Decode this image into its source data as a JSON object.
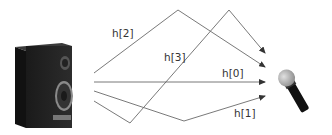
{
  "diagram": {
    "source": {
      "label": "loudspeaker",
      "icon": "speaker-icon"
    },
    "receiver": {
      "label": "microphone",
      "icon": "microphone-icon"
    },
    "paths": [
      {
        "id": "h0",
        "label": "h[0]"
      },
      {
        "id": "h1",
        "label": "h[1]"
      },
      {
        "id": "h2",
        "label": "h[2]"
      },
      {
        "id": "h3",
        "label": "h[3]"
      }
    ],
    "line_color": "#666666"
  }
}
